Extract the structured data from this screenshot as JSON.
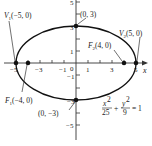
{
  "diagram": {
    "type": "ellipse-graph",
    "equation": {
      "x_num": "x",
      "x_exp": "2",
      "x_den": "25",
      "plus": "+",
      "y_num": "y",
      "y_exp": "2",
      "y_den": "9",
      "equals": "= 1"
    },
    "axes": {
      "x_label": "x",
      "x_ticks": [
        "−5",
        "−3",
        "−1",
        "0",
        "1",
        "3",
        "5"
      ],
      "y_ticks": [
        "5",
        "3",
        "1",
        "−1",
        "−3",
        "−5"
      ]
    },
    "points": {
      "v1": {
        "name": "V",
        "sub": "1",
        "coords": "(−5, 0)"
      },
      "v2": {
        "name": "V",
        "sub": "2",
        "coords": "(5, 0)"
      },
      "f1": {
        "name": "F",
        "sub": "1",
        "coords": "(−4, 0)"
      },
      "f2": {
        "name": "F",
        "sub": "2",
        "coords": "(4, 0)"
      },
      "top": {
        "coords": "(0, 3)"
      },
      "bottom": {
        "coords": "(0, −3)"
      }
    },
    "colors": {
      "stroke": "#111111",
      "text": "#1a1a1a",
      "background": "#ffffff"
    }
  }
}
